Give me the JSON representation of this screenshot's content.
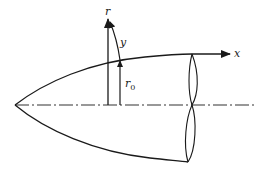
{
  "diagram": {
    "colors": {
      "stroke": "#1a1a1a",
      "background": "#ffffff"
    },
    "labels": {
      "r_axis": "r",
      "x_axis": "x",
      "y_coord": "y",
      "r0_base": "r",
      "r0_sub": "0"
    },
    "elements": [
      "body-upper-contour",
      "body-lower-contour",
      "centerline-dash-dot",
      "r-axis-arrow",
      "x-axis-arrow",
      "y-normal-coordinate-arrow",
      "r0-local-radius-arrow",
      "cross-section-ellipse"
    ]
  }
}
